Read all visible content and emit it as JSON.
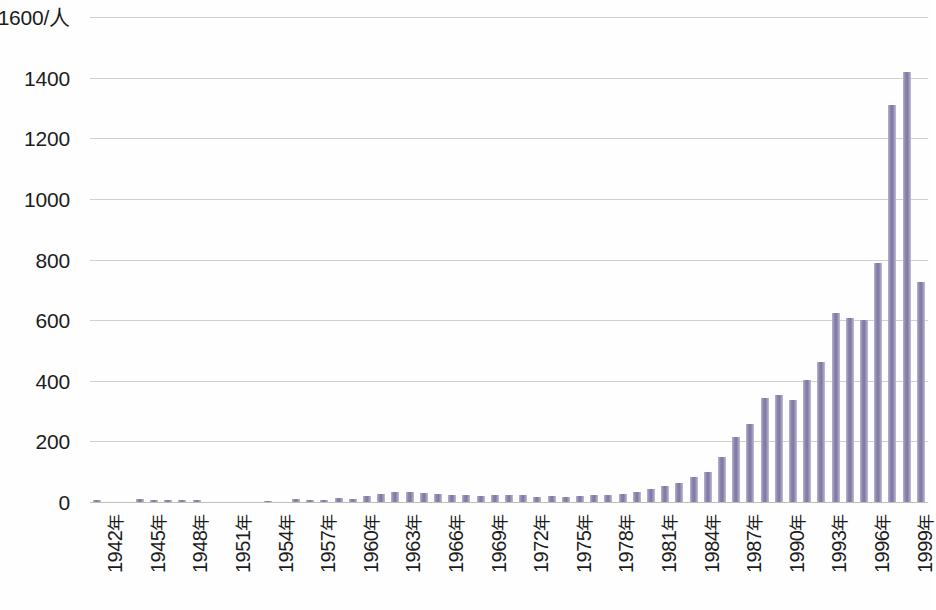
{
  "chart_data": {
    "type": "bar",
    "title": "",
    "subtitle": "",
    "xlabel": "",
    "ylabel": "",
    "y_unit_label": "1600/人",
    "ylim": [
      0,
      1600
    ],
    "y_tick_step": 200,
    "y_ticks": [
      0,
      200,
      400,
      600,
      800,
      1000,
      1200,
      1400,
      1600
    ],
    "y_tick_labels": [
      "0",
      "200",
      "400",
      "600",
      "800",
      "1000",
      "1200",
      "1400",
      "1600/人"
    ],
    "grid": true,
    "grid_axis": "y",
    "legend": "none",
    "bar_color": "#8c86b3",
    "gridline_color": "#c9c9c0",
    "x_tick_interval": 3,
    "x_tick_suffix": "年",
    "categories": [
      "1942年",
      "1943年",
      "1944年",
      "1945年",
      "1946年",
      "1947年",
      "1948年",
      "1949年",
      "1950年",
      "1951年",
      "1952年",
      "1953年",
      "1954年",
      "1955年",
      "1956年",
      "1957年",
      "1958年",
      "1959年",
      "1960年",
      "1961年",
      "1962年",
      "1963年",
      "1964年",
      "1965年",
      "1966年",
      "1967年",
      "1968年",
      "1969年",
      "1970年",
      "1971年",
      "1972年",
      "1973年",
      "1974年",
      "1975年",
      "1976年",
      "1977年",
      "1978年",
      "1979年",
      "1980年",
      "1981年",
      "1982年",
      "1983年",
      "1984年",
      "1985年",
      "1986年",
      "1987年",
      "1988年",
      "1989年",
      "1990年",
      "1991年",
      "1992年",
      "1993年",
      "1994年",
      "1995年",
      "1996年",
      "1997年",
      "1998年",
      "1999年",
      "2000年"
    ],
    "labeled_categories": [
      "1942年",
      "1945年",
      "1948年",
      "1951年",
      "1954年",
      "1957年",
      "1960年",
      "1963年",
      "1966年",
      "1969年",
      "1972年",
      "1975年",
      "1978年",
      "1981年",
      "1984年",
      "1987年",
      "1990年",
      "1993年",
      "1996年",
      "1999年"
    ],
    "values": [
      6,
      0,
      0,
      10,
      8,
      8,
      8,
      7,
      0,
      0,
      0,
      0,
      2,
      0,
      10,
      8,
      8,
      12,
      10,
      20,
      26,
      32,
      34,
      30,
      26,
      22,
      24,
      20,
      24,
      22,
      22,
      18,
      20,
      18,
      20,
      22,
      24,
      26,
      34,
      44,
      54,
      62,
      84,
      100,
      150,
      214,
      258,
      342,
      352,
      338,
      404,
      462,
      622,
      608,
      600,
      790,
      1310,
      1420,
      725
    ],
    "max_value": 1420,
    "min_value": 0
  }
}
